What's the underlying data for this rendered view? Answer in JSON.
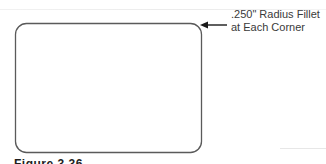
{
  "diagram": {
    "shape": "rounded-rectangle",
    "stroke_color": "#5a5a5a",
    "arrow_color": "#1a1a1a"
  },
  "callout": {
    "line1": ".250\" Radius Fillet",
    "line2": "at Each Corner"
  },
  "caption": {
    "text": "Figure 3.36"
  }
}
